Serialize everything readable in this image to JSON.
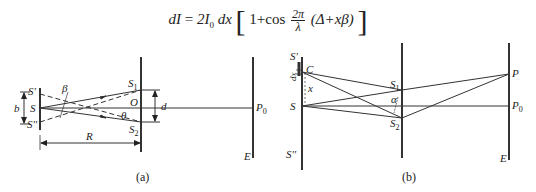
{
  "formula": {
    "lhs": "dI",
    "equals": "=",
    "prefix": "2I",
    "prefix_sub": "0",
    "dx": "dx",
    "bracket_open": "[",
    "one_plus_cos": "1+cos",
    "frac_num": "2π",
    "frac_den": "λ",
    "paren_term": "(Δ+xβ)",
    "bracket_close": "]"
  },
  "figure_a": {
    "caption": "(a)",
    "labels": {
      "S_prime": "S'",
      "S": "S",
      "S_double_prime": "S''",
      "b": "b",
      "beta": "β",
      "S1": "S",
      "S1_sub": "1",
      "S2": "S",
      "S2_sub": "2",
      "O": "O",
      "theta": "θ",
      "d": "d",
      "P0": "P",
      "P0_sub": "0",
      "R": "R",
      "E": "E"
    }
  },
  "figure_b": {
    "caption": "(b)",
    "labels": {
      "S_prime": "S'",
      "C": "C",
      "dx": "dx",
      "x": "x",
      "S": "S",
      "S_double_prime": "S''",
      "S1": "S",
      "S1_sub": "1",
      "S2": "S",
      "S2_sub": "2",
      "alpha": "α",
      "P": "P",
      "P0": "P",
      "P0_sub": "0",
      "E": "E"
    }
  }
}
